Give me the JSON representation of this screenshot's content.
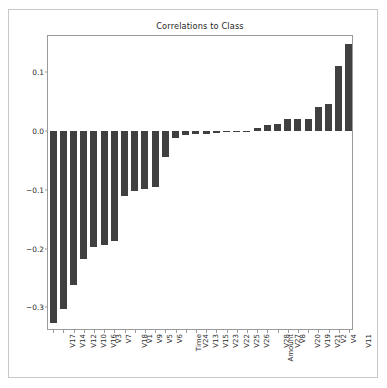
{
  "chart_data": {
    "type": "bar",
    "title": "Correlations to Class",
    "xlabel": "",
    "ylabel": "",
    "grid": false,
    "legend": false,
    "orientation": "vertical",
    "bar_color": "#404040",
    "ylim": [
      -0.34,
      0.162
    ],
    "yticks": [
      0.1,
      0.0,
      -0.1,
      -0.2,
      -0.3
    ],
    "ytick_labels": [
      "0.1",
      "0.0",
      "-0.1",
      "-0.2",
      "-0.3"
    ],
    "categories": [
      "V17",
      "V14",
      "V12",
      "V10",
      "V16",
      "V3",
      "V7",
      "V18",
      "V1",
      "V9",
      "V5",
      "V6",
      "Time",
      "V24",
      "V13",
      "V15",
      "V23",
      "V22",
      "V25",
      "V26",
      "Amount",
      "V28",
      "V27",
      "V8",
      "V20",
      "V19",
      "V21",
      "V2",
      "V4",
      "V11"
    ],
    "values": [
      -0.326,
      -0.303,
      -0.261,
      -0.217,
      -0.197,
      -0.193,
      -0.187,
      -0.111,
      -0.101,
      -0.098,
      -0.095,
      -0.044,
      -0.012,
      -0.007,
      -0.005,
      -0.004,
      -0.003,
      -0.002,
      -0.001,
      0.0,
      0.006,
      0.01,
      0.013,
      0.02,
      0.021,
      0.021,
      0.041,
      0.046,
      0.111,
      0.149
    ]
  },
  "figure": {
    "title_color": "#262626",
    "axes_edge_color": "#9a9a9a",
    "background": "#ffffff"
  }
}
